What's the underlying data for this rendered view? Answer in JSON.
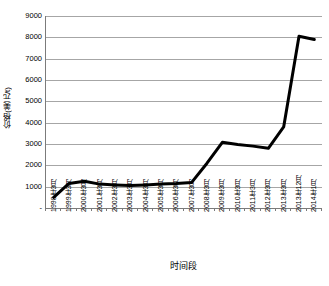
{
  "chart_data": {
    "type": "line",
    "title": "",
    "xlabel": "时间段",
    "ylabel": "价格(美元/t)",
    "ylim": [
      0,
      9000
    ],
    "ytick_values": [
      0,
      1000,
      2000,
      3000,
      4000,
      5000,
      6000,
      7000,
      8000,
      9000
    ],
    "ytick_labels": [
      "-",
      "1000",
      "2000",
      "3000",
      "4000",
      "5000",
      "6000",
      "7000",
      "8000",
      "9000"
    ],
    "grid": true,
    "legend": "none",
    "line_color": "#000000",
    "line_width": 3,
    "categories": [
      "1998年3月",
      "1999年3月",
      "2000年3月",
      "2001年3月",
      "2002年3月",
      "2003年3月",
      "2004年3月",
      "2005年3月",
      "2006年3月",
      "2007年3月",
      "2008年3月",
      "2009年3月",
      "2010年3月",
      "2011年3月",
      "2012年3月",
      "2013年3月",
      "2013年12月",
      "2014年1月"
    ],
    "values": [
      500,
      1150,
      1250,
      1120,
      1080,
      1050,
      1080,
      1120,
      1150,
      1200,
      2100,
      3080,
      2980,
      2900,
      2800,
      3800,
      8050,
      7900
    ]
  }
}
